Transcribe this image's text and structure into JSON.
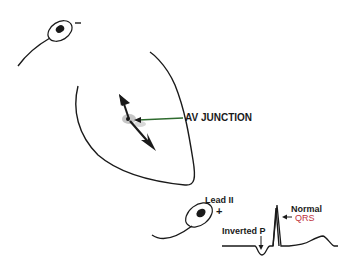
{
  "diagram": {
    "type": "ecg-conduction-schematic",
    "labels": {
      "av_junction": "AV JUNCTION",
      "lead": "Lead II",
      "polarity_plus": "+",
      "polarity_minus": "−",
      "inverted_p": "Inverted P",
      "normal": "Normal",
      "qrs": "QRS"
    },
    "colors": {
      "ink": "#1a1a1a",
      "av_pointer": "#2e6b2e",
      "qrs_text": "#c0303a",
      "junction_glow": "#9a9a9a"
    },
    "elements": [
      {
        "id": "negative-electrode",
        "label": "−"
      },
      {
        "id": "heart-outline"
      },
      {
        "id": "av-junction-focus",
        "label": "AV JUNCTION"
      },
      {
        "id": "retrograde-vector",
        "direction": "up-left"
      },
      {
        "id": "antegrade-vector",
        "direction": "down-right"
      },
      {
        "id": "positive-electrode",
        "label": "Lead II +"
      },
      {
        "id": "ecg-trace",
        "features": [
          "Inverted P",
          "Normal QRS",
          "T wave"
        ]
      }
    ]
  }
}
